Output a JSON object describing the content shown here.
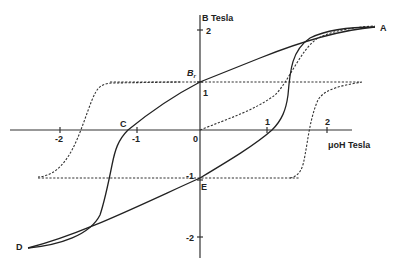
{
  "diagram": {
    "type": "hysteresis-loop",
    "x_axis": {
      "label": "μoH Tesla",
      "ticks": [
        {
          "value": -2,
          "label": "-2"
        },
        {
          "value": -1,
          "label": "-1"
        },
        {
          "value": 0,
          "label": "0"
        },
        {
          "value": 1,
          "label": "1"
        },
        {
          "value": 2,
          "label": "2"
        }
      ]
    },
    "y_axis": {
      "label": "B Tesla",
      "ticks": [
        {
          "value": 2,
          "label": "2"
        },
        {
          "value": 1,
          "label": "1"
        },
        {
          "value": -1,
          "label": "-1"
        },
        {
          "value": -2,
          "label": "-2"
        }
      ]
    },
    "points": {
      "A": "A",
      "Br_base": "B",
      "Br_sub": "r",
      "C": "C",
      "D": "D",
      "E": "E"
    },
    "curves": [
      {
        "name": "B-H hysteresis loop",
        "style": "solid"
      },
      {
        "name": "intrinsic magnetization loop",
        "style": "dashed"
      }
    ]
  }
}
